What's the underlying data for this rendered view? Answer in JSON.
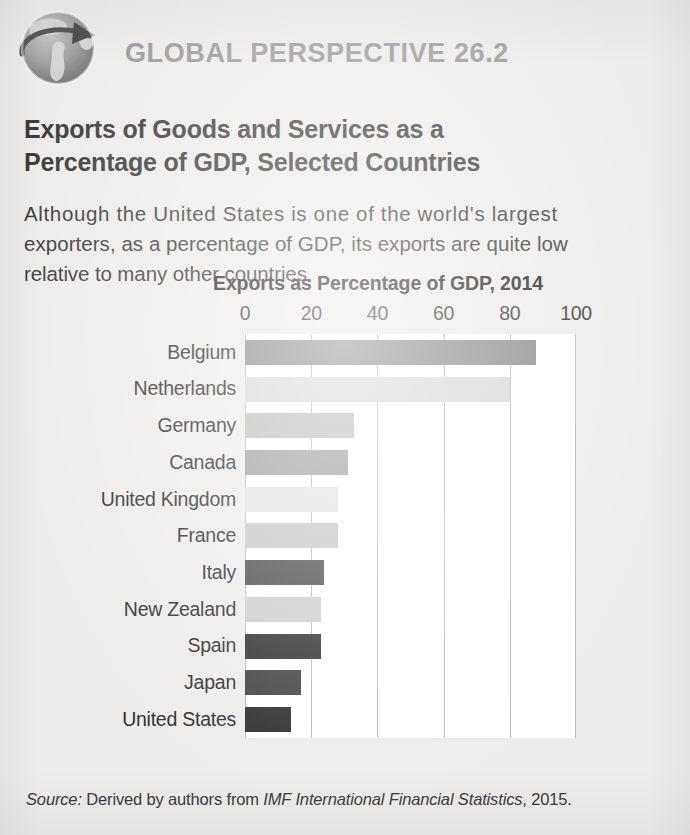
{
  "header": {
    "icon": "globe-icon",
    "kicker": "GLOBAL PERSPECTIVE 26.2",
    "kicker_color": "#9a9a9a"
  },
  "title": {
    "line1": "Exports of Goods and Services as a",
    "line2": "Percentage of GDP, Selected Countries"
  },
  "lede": {
    "line1": "Although the United States is one of the world's largest",
    "line2": "exporters, as a percentage of GDP, its exports are quite low",
    "line3": "relative to many other countries."
  },
  "source": {
    "label": "Source:",
    "text_before": " Derived by authors from ",
    "italic_work": "IMF International Financial Statistics",
    "text_after": ", 2015."
  },
  "chart_data": {
    "type": "bar",
    "orientation": "horizontal",
    "title": "Exports as Percentage of GDP, 2014",
    "xlabel": "",
    "ylabel": "",
    "xlim": [
      0,
      100
    ],
    "xticks": [
      0,
      20,
      40,
      60,
      80,
      100
    ],
    "xtick_labels": [
      "0",
      "20",
      "40",
      "60",
      "80",
      "100"
    ],
    "grid": "vertical-gridlines-at-ticks",
    "legend": "none",
    "plot_background": "#ffffff",
    "gridline_color": "#b9b9b9",
    "categories": [
      "Belgium",
      "Netherlands",
      "Germany",
      "Canada",
      "United Kingdom",
      "France",
      "Italy",
      "New Zealand",
      "Spain",
      "Japan",
      "United States"
    ],
    "values": [
      88,
      80,
      33,
      31,
      28,
      28,
      24,
      23,
      23,
      17,
      14
    ],
    "bar_colors": [
      "#8b8b8b",
      "#d8d8d8",
      "#bdbdbd",
      "#9d9d9d",
      "#e2e2e2",
      "#c6c6c6",
      "#4a4a4a",
      "#cdcdcd",
      "#2e2e2e",
      "#3f3f3f",
      "#2b2b2b"
    ]
  }
}
